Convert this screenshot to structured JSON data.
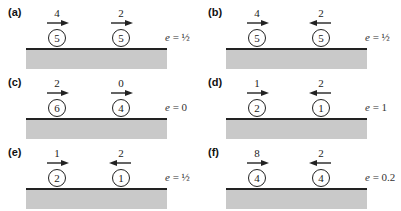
{
  "panels": [
    {
      "label": "(a)",
      "balls": [
        {
          "mass": "5",
          "velocity": "4",
          "direction": "right"
        },
        {
          "mass": "5",
          "velocity": "2",
          "direction": "right"
        }
      ],
      "e_symbol": "e",
      "e_value": "= ½"
    },
    {
      "label": "(b)",
      "balls": [
        {
          "mass": "5",
          "velocity": "4",
          "direction": "right"
        },
        {
          "mass": "5",
          "velocity": "2",
          "direction": "left"
        }
      ],
      "e_symbol": "e",
      "e_value": "= ½"
    },
    {
      "label": "(c)",
      "balls": [
        {
          "mass": "6",
          "velocity": "2",
          "direction": "right"
        },
        {
          "mass": "4",
          "velocity": "0",
          "direction": "right"
        }
      ],
      "e_symbol": "e",
      "e_value": "= 0"
    },
    {
      "label": "(d)",
      "balls": [
        {
          "mass": "2",
          "velocity": "1",
          "direction": "right"
        },
        {
          "mass": "1",
          "velocity": "2",
          "direction": "left"
        }
      ],
      "e_symbol": "e",
      "e_value": "= 1"
    },
    {
      "label": "(e)",
      "balls": [
        {
          "mass": "2",
          "velocity": "1",
          "direction": "right"
        },
        {
          "mass": "1",
          "velocity": "2",
          "direction": "left"
        }
      ],
      "e_symbol": "e",
      "e_value": "= ½"
    },
    {
      "label": "(f)",
      "balls": [
        {
          "mass": "4",
          "velocity": "8",
          "direction": "right"
        },
        {
          "mass": "4",
          "velocity": "2",
          "direction": "left"
        }
      ],
      "e_symbol": "e",
      "e_value": "= 0.2"
    }
  ],
  "colors": {
    "ground_fill": "#c9c9c9",
    "ground_line": "#222222",
    "ink": "#222222"
  }
}
